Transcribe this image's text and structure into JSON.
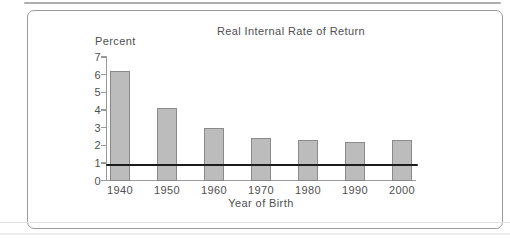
{
  "page": {
    "background": "#ffffff",
    "panel_border_color": "#9a9a9a",
    "top_edge_color": "#aeaeae",
    "crease_color": "#e2e2e2"
  },
  "chart_data": {
    "type": "bar",
    "title": "Real Internal Rate of Return",
    "ylabel": "Percent",
    "xlabel": "Year of Birth",
    "categories": [
      "1940",
      "1950",
      "1960",
      "1970",
      "1980",
      "1990",
      "2000"
    ],
    "values": [
      6.2,
      4.1,
      3.0,
      2.4,
      2.3,
      2.2,
      2.3
    ],
    "ylim": [
      0,
      7
    ],
    "yticks": [
      0,
      1,
      2,
      3,
      4,
      5,
      6,
      7
    ],
    "reference_line": {
      "value": 1,
      "color": "#1c1c1c"
    },
    "grid": false,
    "legend": false,
    "bar_fill": "#bcbcbc",
    "bar_border": "#8a8a8a",
    "axis_color": "#9a9a9a",
    "text_color": "#4f4f4f"
  }
}
